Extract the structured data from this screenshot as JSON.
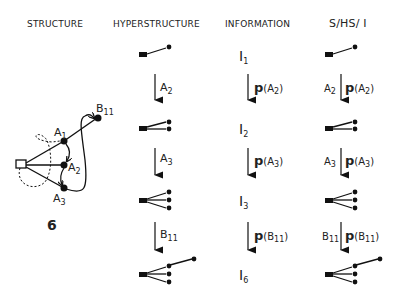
{
  "headers": {
    "structure": "STRUCTURE",
    "hyperstructure": "HYPERSTRUCTURE",
    "information": "INFORMATION",
    "shs_i": "S/HS/ I"
  },
  "structure_graph": {
    "nodes": [
      "A1",
      "A2",
      "A3",
      "B11"
    ],
    "root": "square-node",
    "number": "6"
  },
  "hyperstructure": {
    "transitions": [
      "A2",
      "A3",
      "B11"
    ]
  },
  "information": {
    "states": [
      "I1",
      "I2",
      "I3",
      "I6"
    ],
    "transitions": [
      "p(A2)",
      "p(A3)",
      "p(B11)"
    ]
  },
  "shs_i": {
    "transitions": [
      {
        "left": "A2",
        "right": "p(A2)"
      },
      {
        "left": "A3",
        "right": "p(A3)"
      },
      {
        "left": "B11",
        "right": "p(B11)"
      }
    ]
  }
}
